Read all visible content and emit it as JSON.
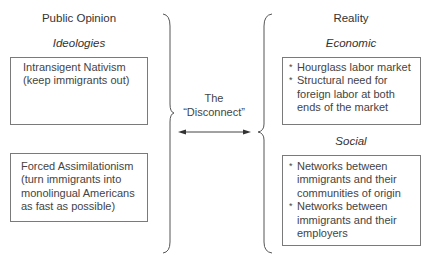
{
  "left_column": {
    "title": "Public Opinion",
    "subtitle": "Ideologies",
    "boxes": [
      {
        "name": "intransigent-nativism",
        "lines": [
          "Intransigent Nativism",
          "(keep immigrants out)"
        ]
      },
      {
        "name": "forced-assimilationism",
        "lines": [
          "Forced Assimilationism",
          "(turn immigrants into",
          "monolingual Americans",
          "as fast as possible)"
        ]
      }
    ]
  },
  "center": {
    "label_line1": "The",
    "label_line2": "“Disconnect”",
    "arrow": "double-headed-arrow"
  },
  "right_column": {
    "title": "Reality",
    "sections": [
      {
        "subtitle": "Economic",
        "bullets": [
          {
            "marker": "*",
            "lines": [
              "Hourglass labor market"
            ]
          },
          {
            "marker": "*",
            "lines": [
              "Structural need for",
              "foreign labor at both",
              "ends of the market"
            ]
          }
        ]
      },
      {
        "subtitle": "Social",
        "bullets": [
          {
            "marker": "*",
            "lines": [
              "Networks between",
              "immigrants and their",
              "communities of origin"
            ]
          },
          {
            "marker": "*",
            "lines": [
              "Networks between",
              "immigrants and their",
              "employers"
            ]
          }
        ]
      }
    ]
  },
  "colors": {
    "text": "#3a3a3a",
    "border": "#7a7a7a",
    "brace": "#555555"
  }
}
